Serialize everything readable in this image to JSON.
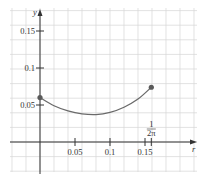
{
  "chart_data": {
    "type": "line",
    "title": "",
    "xlabel": "r",
    "ylabel": "y",
    "xlim": [
      -0.07,
      0.23
    ],
    "ylim": [
      -0.055,
      0.17
    ],
    "grid": true,
    "x_ticks": [
      {
        "value": 0.05,
        "label": "0.05"
      },
      {
        "value": 0.1,
        "label": "0.1"
      },
      {
        "value": 0.15,
        "label": "0.15"
      },
      {
        "value": 0.159,
        "label_num": "1",
        "label_den": "2π"
      }
    ],
    "y_ticks": [
      {
        "value": 0.05,
        "label": "0.05"
      },
      {
        "value": 0.1,
        "label": "0.1"
      },
      {
        "value": 0.15,
        "label": "0.15"
      }
    ],
    "series": [
      {
        "name": "curve",
        "x": [
          0,
          0.02,
          0.04,
          0.06,
          0.08,
          0.1,
          0.12,
          0.14,
          0.159
        ],
        "y": [
          0.06,
          0.049,
          0.042,
          0.038,
          0.037,
          0.04,
          0.047,
          0.058,
          0.074
        ]
      }
    ],
    "endpoints": [
      {
        "x": 0,
        "y": 0.06
      },
      {
        "x": 0.159,
        "y": 0.074
      }
    ]
  }
}
